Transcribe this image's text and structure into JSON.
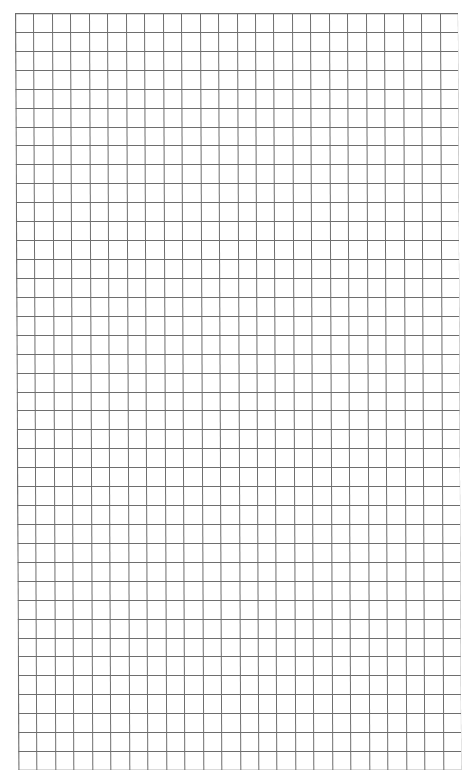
{
  "paper": {
    "type": "graph-paper",
    "columns": 24,
    "rows": 40,
    "line_color": "#6e6e6e",
    "background_color": "#ffffff"
  }
}
